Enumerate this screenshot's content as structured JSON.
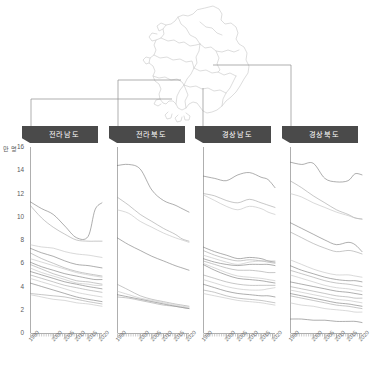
{
  "figure": {
    "unit_label": "만 명",
    "map_name": "south-korea-outline"
  },
  "yaxis": {
    "ticks": [
      "16",
      "14",
      "12",
      "10",
      "8",
      "6",
      "4",
      "2",
      "0"
    ],
    "min": 0,
    "max": 16,
    "step": 2
  },
  "xaxis": {
    "ticks": [
      "1990",
      "2000",
      "2005",
      "2010",
      "2015",
      "2020"
    ],
    "min": 1990,
    "max": 2021
  },
  "panels": [
    {
      "id": "jeollanam",
      "label": "전라남도"
    },
    {
      "id": "jeollabuk",
      "label": "전라북도"
    },
    {
      "id": "gyeongsangnam",
      "label": "경상남도"
    },
    {
      "id": "gyeongsangbuk",
      "label": "경상북도"
    }
  ],
  "colors": {
    "header_bg": "#4a4a4a",
    "header_text": "#ffffff",
    "axis": "#9a9a9a",
    "leader": "#8d8d8d",
    "map_stroke": "#cfcfcf",
    "line_dark": "#6f6f6f",
    "line_mid": "#9c9c9c",
    "line_light": "#bcbcbc"
  },
  "chart_data": {
    "type": "line",
    "title": "",
    "xlabel": "",
    "ylabel": "만 명",
    "xlim": [
      1990,
      2021
    ],
    "ylim": [
      0,
      16
    ],
    "grid": false,
    "legend": "none",
    "layout": "small-multiples, 4 panels side by side, shared y axis",
    "x": [
      1990,
      1995,
      2000,
      2005,
      2010,
      2015,
      2018,
      2021
    ],
    "panels": [
      {
        "name": "전라남도",
        "series": [
          {
            "name": "j-a",
            "values": [
              11.3,
              10.7,
              10.2,
              9.2,
              8.2,
              8.3,
              10.6,
              11.2
            ]
          },
          {
            "name": "j-b",
            "values": [
              11.0,
              9.9,
              9.1,
              8.5,
              8.0,
              7.9,
              7.9,
              7.9
            ]
          },
          {
            "name": "j-c",
            "values": [
              7.6,
              7.4,
              7.3,
              7.0,
              6.8,
              6.7,
              6.6,
              6.5
            ]
          },
          {
            "name": "j-d",
            "values": [
              7.3,
              6.9,
              6.6,
              6.2,
              5.9,
              5.8,
              5.7,
              5.6
            ]
          },
          {
            "name": "j-e",
            "values": [
              6.9,
              6.4,
              6.0,
              5.6,
              5.3,
              5.1,
              5.0,
              4.9
            ]
          },
          {
            "name": "j-f",
            "values": [
              6.4,
              6.1,
              5.8,
              5.5,
              5.2,
              5.0,
              4.9,
              4.8
            ]
          },
          {
            "name": "j-g",
            "values": [
              6.1,
              5.7,
              5.4,
              5.1,
              4.9,
              4.7,
              4.6,
              4.6
            ]
          },
          {
            "name": "j-h",
            "values": [
              5.9,
              5.5,
              5.1,
              4.8,
              4.5,
              4.4,
              4.3,
              4.2
            ]
          },
          {
            "name": "j-i",
            "values": [
              5.6,
              5.2,
              4.9,
              4.6,
              4.3,
              4.2,
              4.1,
              4.1
            ]
          },
          {
            "name": "j-j",
            "values": [
              5.3,
              5.0,
              4.7,
              4.4,
              4.2,
              4.0,
              3.9,
              3.8
            ]
          },
          {
            "name": "j-k",
            "values": [
              5.0,
              4.7,
              4.4,
              4.1,
              3.9,
              3.7,
              3.6,
              3.5
            ]
          },
          {
            "name": "j-l",
            "values": [
              4.7,
              4.4,
              4.1,
              3.8,
              3.5,
              3.3,
              3.2,
              3.1
            ]
          },
          {
            "name": "j-m",
            "values": [
              4.3,
              4.0,
              3.7,
              3.4,
              3.1,
              2.9,
              2.8,
              2.7
            ]
          },
          {
            "name": "j-n",
            "values": [
              3.4,
              3.3,
              3.2,
              3.1,
              2.9,
              2.7,
              2.6,
              2.5
            ]
          },
          {
            "name": "j-o",
            "values": [
              3.3,
              3.1,
              2.9,
              2.8,
              2.6,
              2.5,
              2.4,
              2.3
            ]
          }
        ]
      },
      {
        "name": "전라북도",
        "series": [
          {
            "name": "b-a",
            "values": [
              14.4,
              14.5,
              14.1,
              12.3,
              11.4,
              11.0,
              10.7,
              10.4
            ]
          },
          {
            "name": "b-b",
            "values": [
              11.7,
              11.0,
              10.2,
              9.6,
              9.0,
              8.5,
              8.1,
              7.9
            ]
          },
          {
            "name": "b-c",
            "values": [
              10.6,
              10.3,
              9.6,
              9.1,
              8.6,
              8.2,
              8.0,
              7.8
            ]
          },
          {
            "name": "b-d",
            "values": [
              8.2,
              7.6,
              7.1,
              6.6,
              6.2,
              5.8,
              5.6,
              5.4
            ]
          },
          {
            "name": "b-e",
            "values": [
              4.2,
              3.7,
              3.2,
              2.9,
              2.7,
              2.5,
              2.4,
              2.3
            ]
          },
          {
            "name": "b-f",
            "values": [
              3.6,
              3.3,
              3.0,
              2.8,
              2.6,
              2.4,
              2.3,
              2.2
            ]
          },
          {
            "name": "b-g",
            "values": [
              3.3,
              3.1,
              2.9,
              2.7,
              2.5,
              2.3,
              2.2,
              2.1
            ]
          },
          {
            "name": "b-h",
            "values": [
              3.1,
              3.0,
              2.8,
              2.6,
              2.4,
              2.3,
              2.2,
              2.1
            ]
          }
        ]
      },
      {
        "name": "경상남도",
        "series": [
          {
            "name": "n-a",
            "values": [
              13.5,
              13.3,
              13.1,
              13.6,
              13.8,
              13.4,
              13.2,
              12.5
            ]
          },
          {
            "name": "n-b",
            "values": [
              12.0,
              11.8,
              11.4,
              11.2,
              11.5,
              11.2,
              11.0,
              10.8
            ]
          },
          {
            "name": "n-c",
            "values": [
              11.9,
              11.4,
              10.9,
              10.6,
              10.9,
              10.7,
              10.4,
              10.2
            ]
          },
          {
            "name": "n-d",
            "values": [
              7.4,
              7.0,
              6.7,
              6.4,
              6.5,
              6.4,
              6.2,
              6.1
            ]
          },
          {
            "name": "n-e",
            "values": [
              7.1,
              6.7,
              6.4,
              6.2,
              6.3,
              6.2,
              6.1,
              6.0
            ]
          },
          {
            "name": "n-f",
            "values": [
              6.7,
              6.4,
              6.1,
              5.9,
              6.1,
              6.2,
              6.2,
              6.2
            ]
          },
          {
            "name": "n-g",
            "values": [
              6.4,
              6.1,
              5.9,
              5.8,
              5.9,
              5.9,
              5.9,
              5.8
            ]
          },
          {
            "name": "n-h",
            "values": [
              6.2,
              5.9,
              5.6,
              5.4,
              5.4,
              5.3,
              5.2,
              5.2
            ]
          },
          {
            "name": "n-i",
            "values": [
              6.0,
              5.6,
              5.2,
              4.9,
              4.8,
              4.7,
              4.6,
              4.5
            ]
          },
          {
            "name": "n-j",
            "values": [
              5.9,
              5.4,
              5.0,
              4.7,
              4.6,
              4.5,
              4.4,
              4.3
            ]
          },
          {
            "name": "n-k",
            "values": [
              5.0,
              4.7,
              4.4,
              4.2,
              4.1,
              4.1,
              4.1,
              4.1
            ]
          },
          {
            "name": "n-l",
            "values": [
              4.6,
              4.3,
              4.0,
              3.8,
              3.7,
              3.7,
              3.8,
              3.9
            ]
          },
          {
            "name": "n-m",
            "values": [
              4.2,
              3.9,
              3.6,
              3.4,
              3.3,
              3.2,
              3.2,
              3.1
            ]
          },
          {
            "name": "n-n",
            "values": [
              3.7,
              3.5,
              3.2,
              3.0,
              2.9,
              2.8,
              2.7,
              2.6
            ]
          },
          {
            "name": "n-o",
            "values": [
              3.4,
              3.2,
              3.0,
              2.8,
              2.7,
              2.6,
              2.5,
              2.4
            ]
          }
        ]
      },
      {
        "name": "경상북도",
        "series": [
          {
            "name": "k-a",
            "values": [
              14.7,
              14.5,
              14.6,
              13.3,
              13.0,
              13.1,
              13.7,
              13.6
            ]
          },
          {
            "name": "k-b",
            "values": [
              13.1,
              12.5,
              11.8,
              11.2,
              10.6,
              10.2,
              9.9,
              9.8
            ]
          },
          {
            "name": "k-c",
            "values": [
              12.0,
              11.7,
              11.2,
              10.8,
              10.4,
              10.1,
              9.9,
              9.8
            ]
          },
          {
            "name": "k-d",
            "values": [
              9.5,
              9.0,
              8.5,
              8.0,
              7.6,
              7.8,
              7.6,
              7.0
            ]
          },
          {
            "name": "k-e",
            "values": [
              8.7,
              8.2,
              7.7,
              7.3,
              7.0,
              7.1,
              7.0,
              6.8
            ]
          },
          {
            "name": "k-f",
            "values": [
              6.3,
              5.9,
              5.5,
              5.2,
              5.0,
              5.0,
              4.9,
              4.8
            ]
          },
          {
            "name": "k-g",
            "values": [
              5.8,
              5.4,
              5.1,
              4.8,
              4.6,
              4.5,
              4.5,
              4.4
            ]
          },
          {
            "name": "k-h",
            "values": [
              5.4,
              5.1,
              4.8,
              4.5,
              4.3,
              4.2,
              4.1,
              4.0
            ]
          },
          {
            "name": "k-i",
            "values": [
              5.0,
              4.7,
              4.4,
              4.1,
              3.9,
              3.8,
              3.7,
              3.6
            ]
          },
          {
            "name": "k-j",
            "values": [
              4.4,
              4.2,
              4.0,
              3.8,
              3.6,
              3.5,
              3.4,
              3.3
            ]
          },
          {
            "name": "k-k",
            "values": [
              4.0,
              3.8,
              3.6,
              3.4,
              3.2,
              3.1,
              3.0,
              3.0
            ]
          },
          {
            "name": "k-l",
            "values": [
              3.7,
              3.5,
              3.3,
              3.1,
              2.9,
              2.8,
              2.7,
              2.6
            ]
          },
          {
            "name": "k-m",
            "values": [
              3.4,
              3.2,
              3.0,
              2.8,
              2.6,
              2.5,
              2.4,
              2.3
            ]
          },
          {
            "name": "k-n",
            "values": [
              3.2,
              3.0,
              2.8,
              2.6,
              2.4,
              2.3,
              2.2,
              2.1
            ]
          },
          {
            "name": "k-o",
            "values": [
              2.6,
              2.4,
              2.3,
              2.1,
              2.0,
              1.9,
              1.8,
              1.8
            ]
          },
          {
            "name": "k-p",
            "values": [
              1.2,
              1.2,
              1.1,
              1.1,
              1.0,
              1.0,
              1.0,
              0.9
            ]
          }
        ]
      }
    ]
  }
}
